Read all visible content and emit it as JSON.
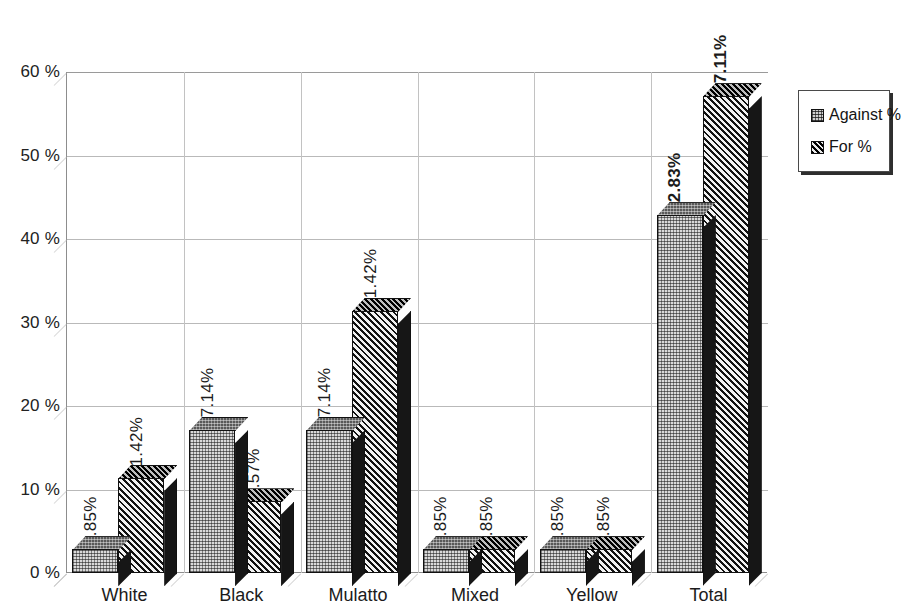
{
  "chart_data": {
    "type": "bar",
    "title": "",
    "subtitle": "",
    "xlabel": "",
    "ylabel": "",
    "categories": [
      "White",
      "Black",
      "Mulatto",
      "Mixed",
      "Yellow",
      "Total"
    ],
    "series": [
      {
        "name": "Against %",
        "values": [
          2.85,
          17.14,
          17.14,
          2.85,
          2.85,
          42.83
        ],
        "labels": [
          "2.85%",
          "17.14%",
          "17.14%",
          "2.85%",
          "2.85%",
          "42.83%"
        ],
        "pattern": "dotted",
        "color": "#d9d9d9"
      },
      {
        "name": "For %",
        "values": [
          11.42,
          8.57,
          31.42,
          2.85,
          2.85,
          57.11
        ],
        "labels": [
          "11.42%",
          "8.57%",
          "31.42%",
          "2.85%",
          "2.85%",
          "57.11%"
        ],
        "pattern": "diagonal-hatch",
        "color": "#6f6f6f"
      }
    ],
    "bold_label_categories": [
      "Total"
    ],
    "ylim": [
      0,
      60
    ],
    "ytick_values": [
      0,
      10,
      20,
      30,
      40,
      50,
      60
    ],
    "ytick_labels": [
      "0 %",
      "10 %",
      "20 %",
      "30 %",
      "40 %",
      "50 %",
      "60 %"
    ],
    "grid": true,
    "grid_orientation": "both",
    "legend_position": "right",
    "style": "3d-clustered-column",
    "value_suffix": "%"
  },
  "legend": {
    "items": [
      {
        "label": "Against %",
        "swatch": "against-swatch-icon"
      },
      {
        "label": "For %",
        "swatch": "for-swatch-icon"
      }
    ]
  }
}
